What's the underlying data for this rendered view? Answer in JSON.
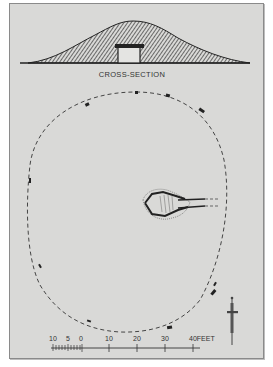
{
  "figure": {
    "cross_section_label": "CROSS-SECTION",
    "scale_bar": {
      "unit": "FEET",
      "ticks": [
        "10",
        "5",
        "0",
        "10",
        "20",
        "30",
        "40"
      ],
      "last_label": "40FEET"
    },
    "north_arrow": "north-arrow",
    "colors": {
      "paper": "#d9d9d7",
      "ink": "#2e2e2e",
      "frame": "#8a8a8a"
    }
  }
}
